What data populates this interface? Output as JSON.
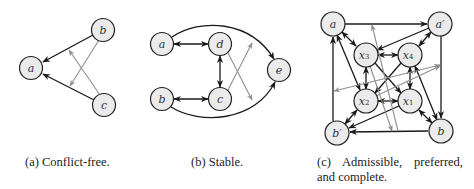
{
  "figure": {
    "panels": [
      {
        "id": "a",
        "caption": "(a) Conflict-free.",
        "nodes": [
          {
            "id": "a",
            "label": "a",
            "x": 31,
            "y": 68
          },
          {
            "id": "b",
            "label": "b",
            "x": 103,
            "y": 30
          },
          {
            "id": "c",
            "label": "c",
            "x": 104,
            "y": 105
          }
        ],
        "edges": [
          {
            "from": "b",
            "to": "a",
            "style": "black",
            "type": "attack"
          },
          {
            "from": "c",
            "to": "a",
            "style": "black",
            "type": "attack"
          },
          {
            "from": "b",
            "to": "edge(c,a)",
            "style": "gray",
            "type": "attack-on-attack"
          },
          {
            "from": "c",
            "to": "edge(b,a)",
            "style": "gray",
            "type": "attack-on-attack"
          }
        ]
      },
      {
        "id": "b",
        "caption": "(b) Stable.",
        "nodes": [
          {
            "id": "a",
            "label": "a",
            "x": 162,
            "y": 44
          },
          {
            "id": "d",
            "label": "d",
            "x": 220,
            "y": 44
          },
          {
            "id": "e",
            "label": "e",
            "x": 279,
            "y": 70
          },
          {
            "id": "b",
            "label": "b",
            "x": 162,
            "y": 99
          },
          {
            "id": "c",
            "label": "c",
            "x": 220,
            "y": 99
          }
        ],
        "edges": [
          {
            "from": "a",
            "to": "d",
            "style": "black",
            "type": "mutual"
          },
          {
            "from": "b",
            "to": "c",
            "style": "black",
            "type": "mutual"
          },
          {
            "from": "d",
            "to": "c",
            "style": "black",
            "type": "mutual"
          },
          {
            "from": "a",
            "to": "e",
            "style": "black",
            "type": "attack",
            "curved": "top"
          },
          {
            "from": "b",
            "to": "e",
            "style": "black",
            "type": "attack",
            "curved": "bottom"
          },
          {
            "from": "d",
            "to": "edge(b,e)",
            "style": "gray",
            "type": "attack-on-attack"
          },
          {
            "from": "c",
            "to": "edge(a,e)",
            "style": "gray",
            "type": "attack-on-attack"
          }
        ]
      },
      {
        "id": "c",
        "caption_line1": "(c) Admissible, preferred,",
        "caption_line2": "and complete.",
        "nodes": [
          {
            "id": "a",
            "label": "a",
            "x": 333,
            "y": 24
          },
          {
            "id": "a'",
            "label": "a′",
            "x": 440,
            "y": 24
          },
          {
            "id": "x3",
            "label": "x",
            "sub": "3",
            "x": 366,
            "y": 55
          },
          {
            "id": "x4",
            "label": "x",
            "sub": "4",
            "x": 410,
            "y": 55
          },
          {
            "id": "x2",
            "label": "x",
            "sub": "2",
            "x": 366,
            "y": 101
          },
          {
            "id": "x1",
            "label": "x",
            "sub": "1",
            "x": 410,
            "y": 101
          },
          {
            "id": "b'",
            "label": "b′",
            "x": 337,
            "y": 133
          },
          {
            "id": "b",
            "label": "b",
            "x": 441,
            "y": 131
          }
        ],
        "edges": [
          {
            "from": "a",
            "to": "a'",
            "style": "black",
            "type": "attack"
          },
          {
            "from": "a'",
            "to": "b",
            "style": "black",
            "type": "attack"
          },
          {
            "from": "b",
            "to": "b'",
            "style": "black",
            "type": "attack"
          },
          {
            "from": "b'",
            "to": "a",
            "style": "black",
            "type": "attack"
          },
          {
            "from": "a",
            "to": "x3",
            "style": "black",
            "type": "mutual"
          },
          {
            "from": "a'",
            "to": "x4",
            "style": "black",
            "type": "mutual"
          },
          {
            "from": "b'",
            "to": "x2",
            "style": "black",
            "type": "mutual"
          },
          {
            "from": "b",
            "to": "x1",
            "style": "black",
            "type": "mutual"
          },
          {
            "from": "x3",
            "to": "x4",
            "style": "black",
            "type": "mutual"
          },
          {
            "from": "x2",
            "to": "x1",
            "style": "black",
            "type": "mutual"
          },
          {
            "from": "x3",
            "to": "x2",
            "style": "black",
            "type": "mutual"
          },
          {
            "from": "x4",
            "to": "x1",
            "style": "black",
            "type": "mutual"
          },
          {
            "from": "a",
            "to": "x2",
            "style": "black",
            "type": "mutual"
          },
          {
            "from": "b",
            "to": "x4",
            "style": "black",
            "type": "mutual"
          },
          {
            "from": "a'",
            "to": "x3",
            "style": "black",
            "type": "attack"
          },
          {
            "from": "x1",
            "to": "b'",
            "style": "black",
            "type": "attack"
          },
          {
            "from": "x3",
            "to": "x1",
            "style": "black",
            "type": "attack"
          },
          {
            "from": "x4",
            "to": "x2",
            "style": "black",
            "type": "attack"
          },
          {
            "from": "edge(b,b')",
            "to": "edge(a,a')",
            "style": "gray",
            "type": "attack-on-attack"
          },
          {
            "from": "edge(a',b)",
            "to": "edge(b',a)",
            "style": "gray",
            "type": "mutual-attack-on-attack"
          },
          {
            "from": "x2",
            "to": "edge(a',b)",
            "style": "gray",
            "type": "attack-on-attack"
          },
          {
            "from": "x3",
            "to": "edge(b,b')",
            "style": "gray",
            "type": "attack-on-attack"
          }
        ]
      }
    ]
  }
}
